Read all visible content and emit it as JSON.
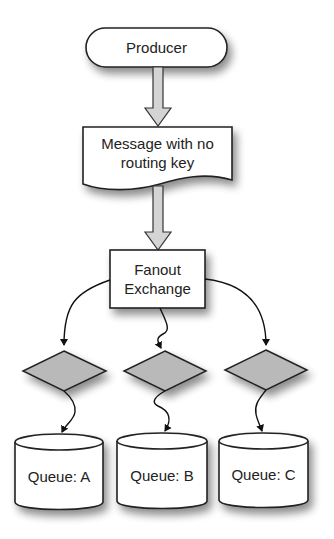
{
  "diagram": {
    "type": "flowchart",
    "nodes": {
      "producer": {
        "label": "Producer",
        "shape": "terminator"
      },
      "message": {
        "label_line1": "Message with no",
        "label_line2": "routing key",
        "shape": "document"
      },
      "exchange": {
        "label_line1": "Fanout",
        "label_line2": "Exchange",
        "shape": "process"
      },
      "binding_a": {
        "label": "",
        "shape": "decision"
      },
      "binding_b": {
        "label": "",
        "shape": "decision"
      },
      "binding_c": {
        "label": "",
        "shape": "decision"
      },
      "queue_a": {
        "label": "Queue: A",
        "shape": "cylinder"
      },
      "queue_b": {
        "label": "Queue: B",
        "shape": "cylinder"
      },
      "queue_c": {
        "label": "Queue: C",
        "shape": "cylinder"
      }
    },
    "edges": [
      {
        "from": "producer",
        "to": "message",
        "style": "block-arrow"
      },
      {
        "from": "message",
        "to": "exchange",
        "style": "block-arrow"
      },
      {
        "from": "exchange",
        "to": "binding_a",
        "style": "curved-arrow"
      },
      {
        "from": "exchange",
        "to": "binding_b",
        "style": "wavy-arrow"
      },
      {
        "from": "exchange",
        "to": "binding_c",
        "style": "curved-arrow"
      },
      {
        "from": "binding_a",
        "to": "queue_a",
        "style": "wavy-arrow"
      },
      {
        "from": "binding_b",
        "to": "queue_b",
        "style": "wavy-arrow"
      },
      {
        "from": "binding_c",
        "to": "queue_c",
        "style": "wavy-arrow"
      }
    ],
    "colors": {
      "stroke": "#222222",
      "node_fill": "#ffffff",
      "decision_fill": "#b9b9b9",
      "block_arrow_fill": "#d4d4d4"
    }
  }
}
